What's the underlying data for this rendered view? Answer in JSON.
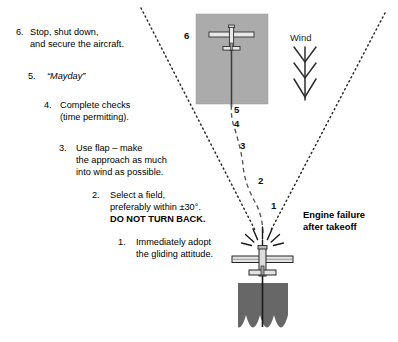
{
  "diagram": {
    "title_hidden": "",
    "background_color": "#ffffff",
    "field_color": "#ababab",
    "trees_color": "#676767",
    "line_color": "#1a1a1a"
  },
  "steps": [
    {
      "number": "6.",
      "lines": [
        "Stop, shut down,",
        "and secure the aircraft."
      ],
      "style": "normal"
    },
    {
      "number": "5.",
      "lines": [
        "“Mayday”"
      ],
      "style": "italic"
    },
    {
      "number": "4.",
      "lines": [
        "Complete checks",
        "(time permitting)."
      ],
      "style": "normal"
    },
    {
      "number": "3.",
      "lines": [
        "Use flap – make",
        "the approach as much",
        "into wind as possible."
      ],
      "style": "normal"
    },
    {
      "number": "2.",
      "lines": [
        "Select a field,",
        "preferably within ±30°.",
        "DO NOT TURN BACK."
      ],
      "style": "normal",
      "bold_line_index": 2
    },
    {
      "number": "1.",
      "lines": [
        "Immediately adopt",
        "the gliding attitude."
      ],
      "style": "normal"
    }
  ],
  "waypoints": [
    {
      "label": "6"
    },
    {
      "label": "5"
    },
    {
      "label": "4"
    },
    {
      "label": "3"
    },
    {
      "label": "2"
    },
    {
      "label": "1"
    }
  ],
  "wind": {
    "label": "Wind",
    "direction": "down",
    "barb_count": 3
  },
  "engine_failure": {
    "line1": "Engine failure",
    "line2": "after takeoff"
  }
}
